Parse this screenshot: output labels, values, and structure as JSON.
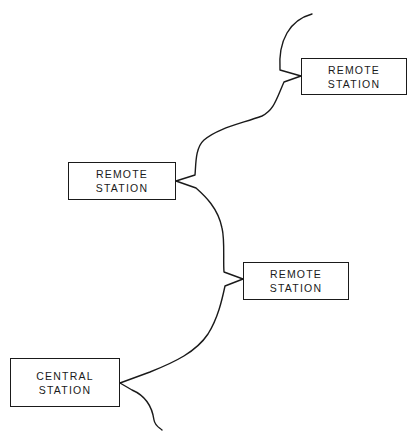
{
  "diagram": {
    "type": "network topology",
    "line_color": "#1a1a1a",
    "nodes": [
      {
        "id": "remote-1",
        "line1": "REMOTE",
        "line2": "STATION",
        "x": 301,
        "y": 58,
        "w": 106,
        "h": 37
      },
      {
        "id": "remote-2",
        "line1": "REMOTE",
        "line2": "STATION",
        "x": 68,
        "y": 162,
        "w": 108,
        "h": 38
      },
      {
        "id": "remote-3",
        "line1": "REMOTE",
        "line2": "STATION",
        "x": 243,
        "y": 262,
        "w": 106,
        "h": 38
      },
      {
        "id": "central",
        "line1": "CENTRAL",
        "line2": "STATION",
        "x": 10,
        "y": 358,
        "w": 110,
        "h": 49
      }
    ],
    "connections": [
      "central-remote-3",
      "remote-3-remote-2",
      "remote-2-remote-1"
    ]
  }
}
